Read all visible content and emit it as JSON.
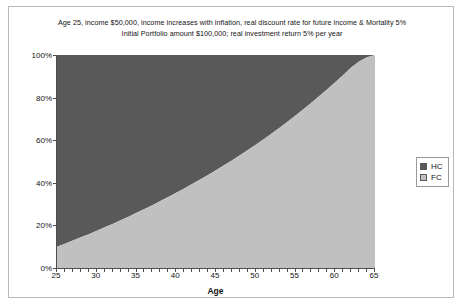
{
  "title": {
    "line1": "Age 25, income $50,000, income increases with inflation, real discount rate for future income & Mortality 5%",
    "line2": "Initial Portfolio amount $100,000; real investment return 5% per year"
  },
  "axis": {
    "x_title": "Age",
    "y_title": "",
    "y_ticks": [
      "0%",
      "20%",
      "40%",
      "60%",
      "80%",
      "100%"
    ],
    "x_ticks": [
      "25",
      "30",
      "35",
      "40",
      "45",
      "50",
      "55",
      "60",
      "65"
    ]
  },
  "legend": {
    "position": "right",
    "items": [
      {
        "label": "HC",
        "color": "#595959"
      },
      {
        "label": "FC",
        "color": "#c0c0c0"
      }
    ]
  },
  "colors": {
    "hc": "#595959",
    "fc": "#c0c0c0",
    "axis": "#4d4d4d",
    "frame": "#b9b9b9",
    "text": "#141414"
  },
  "chart_data": {
    "type": "area",
    "stacked": "100%",
    "xlabel": "Age",
    "ylabel": "",
    "xlim": [
      25,
      65
    ],
    "ylim": [
      0,
      100
    ],
    "grid": false,
    "legend_position": "right",
    "x": [
      25,
      26,
      27,
      28,
      29,
      30,
      31,
      32,
      33,
      34,
      35,
      36,
      37,
      38,
      39,
      40,
      41,
      42,
      43,
      44,
      45,
      46,
      47,
      48,
      49,
      50,
      51,
      52,
      53,
      54,
      55,
      56,
      57,
      58,
      59,
      60,
      61,
      62,
      63,
      64,
      65
    ],
    "series": [
      {
        "name": "FC",
        "color": "#c0c0c0",
        "values": [
          10,
          11.4,
          12.9,
          14.4,
          15.9,
          17.5,
          19.1,
          20.7,
          22.4,
          24.1,
          25.9,
          27.7,
          29.5,
          31.4,
          33.3,
          35.3,
          37.3,
          39.4,
          41.5,
          43.7,
          45.9,
          48.2,
          50.5,
          52.9,
          55.4,
          57.9,
          60.5,
          63.2,
          65.9,
          68.7,
          71.6,
          74.5,
          77.6,
          80.7,
          83.9,
          87.2,
          90.6,
          94.1,
          97.0,
          99.0,
          100
        ]
      },
      {
        "name": "HC",
        "color": "#595959",
        "values": [
          90,
          88.6,
          87.1,
          85.6,
          84.1,
          82.5,
          80.9,
          79.3,
          77.6,
          75.9,
          74.1,
          72.3,
          70.5,
          68.6,
          66.7,
          64.7,
          62.7,
          60.6,
          58.5,
          56.3,
          54.1,
          51.8,
          49.5,
          47.1,
          44.6,
          42.1,
          39.5,
          36.8,
          34.1,
          31.3,
          28.4,
          25.5,
          22.4,
          19.3,
          16.1,
          12.8,
          9.4,
          5.9,
          3.0,
          1.0,
          0
        ]
      }
    ]
  }
}
